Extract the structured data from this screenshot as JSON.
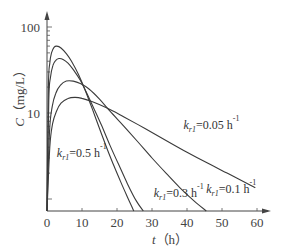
{
  "chart_data": {
    "type": "line",
    "title": "",
    "xlabel": "t（h）",
    "ylabel": "C（mg/L）",
    "x_var": "t",
    "x_unit": "（h）",
    "y_var": "C",
    "y_unit": "（mg/L）",
    "xlim": [
      0,
      62
    ],
    "ylim": [
      0.72,
      150
    ],
    "yscale": "log",
    "grid": false,
    "legend_position": "none (inline annotations)",
    "x_ticks": [
      0,
      10,
      20,
      30,
      40,
      50,
      60
    ],
    "x_tick_labels": [
      "0",
      "10",
      "20",
      "30",
      "40",
      "50",
      "60"
    ],
    "y_ticks": [
      10,
      100
    ],
    "y_tick_labels": [
      "10",
      "100"
    ],
    "series": [
      {
        "name": "k_r1=0.5 h^-1",
        "k": 0.5,
        "label": {
          "prefix": "k",
          "sub": "r1",
          "text": "=0.5 h",
          "sup": "-1",
          "x": 2.8,
          "y_px": 157
        },
        "points": [
          [
            0,
            0.72
          ],
          [
            0.4,
            20
          ],
          [
            0.8,
            38
          ],
          [
            1.3,
            50
          ],
          [
            2,
            58
          ],
          [
            2.8,
            60
          ],
          [
            4,
            57
          ],
          [
            5.5,
            49
          ],
          [
            7,
            40
          ],
          [
            9,
            28
          ],
          [
            11,
            18
          ],
          [
            13,
            11
          ],
          [
            15,
            6.6
          ],
          [
            17,
            4
          ],
          [
            19,
            2.5
          ],
          [
            21,
            1.6
          ],
          [
            23,
            1.05
          ],
          [
            24.8,
            0.72
          ]
        ]
      },
      {
        "name": "k_r1=0.3 h^-1",
        "k": 0.3,
        "label": {
          "prefix": "k",
          "sub": "r1",
          "text": "=0.3 h",
          "sup": "-1",
          "x": 30.5,
          "y_px": 197
        },
        "points": [
          [
            0,
            0.72
          ],
          [
            0.5,
            14
          ],
          [
            1,
            26
          ],
          [
            1.7,
            36
          ],
          [
            2.5,
            41
          ],
          [
            3.4,
            43
          ],
          [
            4.6,
            42
          ],
          [
            6,
            38
          ],
          [
            7.5,
            32
          ],
          [
            9.5,
            24
          ],
          [
            11.5,
            16.5
          ],
          [
            13.5,
            11
          ],
          [
            15.5,
            7.3
          ],
          [
            18,
            4.2
          ],
          [
            20.5,
            2.5
          ],
          [
            23,
            1.5
          ],
          [
            25.5,
            0.95
          ],
          [
            27.5,
            0.72
          ]
        ]
      },
      {
        "name": "k_r1=0.1 h^-1",
        "k": 0.1,
        "label": {
          "prefix": "k",
          "sub": "r1",
          "text": "=0.1 h",
          "sup": "-1",
          "x": 45.5,
          "y_px": 193
        },
        "points": [
          [
            0,
            0.72
          ],
          [
            0.7,
            6
          ],
          [
            1.5,
            12
          ],
          [
            2.5,
            17
          ],
          [
            3.8,
            21
          ],
          [
            5.5,
            23.5
          ],
          [
            7.5,
            23.5
          ],
          [
            9.5,
            22
          ],
          [
            12,
            19
          ],
          [
            15,
            14.5
          ],
          [
            18,
            10.5
          ],
          [
            22,
            7
          ],
          [
            26,
            4.6
          ],
          [
            30,
            3
          ],
          [
            34,
            2
          ],
          [
            38,
            1.35
          ],
          [
            42,
            0.95
          ],
          [
            45.5,
            0.72
          ]
        ]
      },
      {
        "name": "k_r1=0.05 h^-1",
        "k": 0.05,
        "label": {
          "prefix": "k",
          "sub": "r1",
          "text": "=0.05 h",
          "sup": "-1",
          "x": 39,
          "y_px": 129
        },
        "points": [
          [
            0,
            0.72
          ],
          [
            0.8,
            4
          ],
          [
            1.6,
            7.5
          ],
          [
            2.7,
            10.5
          ],
          [
            4,
            13
          ],
          [
            6,
            14.8
          ],
          [
            8,
            15.2
          ],
          [
            10,
            14.8
          ],
          [
            13,
            13.5
          ],
          [
            17,
            11.5
          ],
          [
            22,
            9
          ],
          [
            28,
            6.6
          ],
          [
            34,
            4.8
          ],
          [
            40,
            3.5
          ],
          [
            46,
            2.6
          ],
          [
            52,
            1.95
          ],
          [
            58,
            1.45
          ],
          [
            59.5,
            1.35
          ]
        ]
      }
    ]
  }
}
